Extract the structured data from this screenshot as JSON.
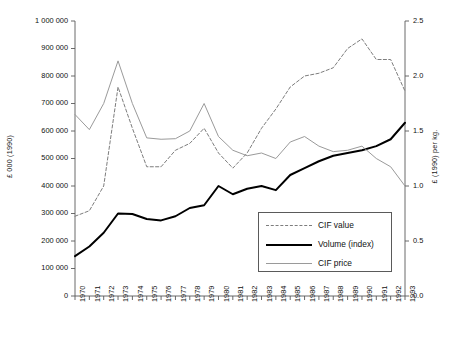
{
  "chart_data": {
    "type": "line",
    "title": "",
    "clipped_title_fragment": "",
    "xlabel": "",
    "ylabel": "£ 000 (1990)",
    "y2label": "£ (1990) per kg.",
    "grid": false,
    "legend_position": "inside-center-right",
    "xlim": [
      1970,
      1993
    ],
    "ylim": [
      0,
      1000000
    ],
    "y2lim": [
      0.0,
      2.5
    ],
    "x": [
      1970,
      1971,
      1972,
      1973,
      1974,
      1975,
      1976,
      1977,
      1978,
      1979,
      1980,
      1981,
      1982,
      1983,
      1984,
      1985,
      1986,
      1987,
      1988,
      1989,
      1990,
      1991,
      1992,
      1993
    ],
    "categories": [
      "1970",
      "1971",
      "1972",
      "1973",
      "1974",
      "1975",
      "1976",
      "1977",
      "1978",
      "1979",
      "1980",
      "1981",
      "1982",
      "1983",
      "1984",
      "1985",
      "1986",
      "1987",
      "1988",
      "1989",
      "1990",
      "1991",
      "1992",
      "1993"
    ],
    "ytick_labels": [
      "1 000 000",
      "900 000",
      "800 000",
      "700 000",
      "600 000",
      "500 000",
      "400 000",
      "300 000",
      "200 000",
      "100 000",
      "0"
    ],
    "ytick_values": [
      1000000,
      900000,
      800000,
      700000,
      600000,
      500000,
      400000,
      300000,
      200000,
      100000,
      0
    ],
    "y2tick_labels": [
      "2.5",
      "2.0",
      "1.5",
      "1.0",
      "0.5",
      "0.0"
    ],
    "y2tick_values": [
      2.5,
      2.0,
      1.5,
      1.0,
      0.5,
      0.0
    ],
    "series": [
      {
        "name": "CIF value",
        "axis": "left",
        "style": "dashed",
        "color": "#7d7d7d",
        "width": 1,
        "values": [
          290000,
          310000,
          400000,
          760000,
          610000,
          470000,
          470000,
          530000,
          555000,
          610000,
          520000,
          465000,
          520000,
          610000,
          680000,
          760000,
          800000,
          810000,
          830000,
          900000,
          935000,
          860000,
          860000,
          745000
        ]
      },
      {
        "name": "Volume (index)",
        "axis": "left",
        "style": "solid",
        "color": "#000000",
        "width": 2,
        "values": [
          145000,
          180000,
          230000,
          300000,
          298000,
          280000,
          275000,
          290000,
          320000,
          330000,
          400000,
          370000,
          390000,
          400000,
          385000,
          440000,
          465000,
          490000,
          510000,
          520000,
          530000,
          545000,
          570000,
          630000
        ]
      },
      {
        "name": "CIF price",
        "axis": "left",
        "style": "solid",
        "color": "#9a9a9a",
        "width": 1,
        "values": [
          660000,
          605000,
          700000,
          855000,
          700000,
          575000,
          570000,
          572000,
          600000,
          700000,
          580000,
          530000,
          510000,
          520000,
          500000,
          560000,
          580000,
          545000,
          525000,
          530000,
          545000,
          500000,
          470000,
          400000
        ]
      }
    ]
  },
  "axes": {
    "left_title": "£ 000 (1990)",
    "right_title": "£ (1990) per kg."
  },
  "legend": {
    "items": [
      {
        "label": "CIF value",
        "swatch": "dashed-line-swatch"
      },
      {
        "label": "Volume (index)",
        "swatch": "thick-solid-line-swatch"
      },
      {
        "label": "CIF price",
        "swatch": "thin-solid-line-swatch"
      }
    ]
  },
  "colors": {
    "cif_value": "#7d7d7d",
    "volume_index": "#000000",
    "cif_price": "#9a9a9a",
    "axis": "#5a5a5a",
    "background": "#ffffff"
  }
}
